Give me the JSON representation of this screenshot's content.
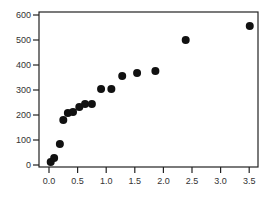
{
  "chart_data": {
    "type": "scatter",
    "title": "",
    "xlabel": "",
    "ylabel": "",
    "xlim": [
      -0.05,
      3.6
    ],
    "ylim": [
      -10,
      610
    ],
    "x_ticks": [
      0.0,
      0.5,
      1.0,
      1.5,
      2.0,
      2.5,
      3.0,
      3.5
    ],
    "x_tick_labels": [
      "0.0",
      "0.5",
      "1.0",
      "1.5",
      "2.0",
      "2.5",
      "3.0",
      "3.5"
    ],
    "y_ticks": [
      0,
      100,
      200,
      300,
      400,
      500,
      600
    ],
    "y_tick_labels": [
      "0",
      "100",
      "200",
      "300",
      "400",
      "500",
      "600"
    ],
    "grid": false,
    "legend": null,
    "marker_color": "#111111",
    "series": [
      {
        "name": "data",
        "points": [
          {
            "x": 0.03,
            "y": 12
          },
          {
            "x": 0.09,
            "y": 28
          },
          {
            "x": 0.19,
            "y": 84
          },
          {
            "x": 0.25,
            "y": 180
          },
          {
            "x": 0.33,
            "y": 208
          },
          {
            "x": 0.42,
            "y": 212
          },
          {
            "x": 0.53,
            "y": 232
          },
          {
            "x": 0.63,
            "y": 244
          },
          {
            "x": 0.75,
            "y": 244
          },
          {
            "x": 0.91,
            "y": 304
          },
          {
            "x": 1.09,
            "y": 304
          },
          {
            "x": 1.28,
            "y": 356
          },
          {
            "x": 1.54,
            "y": 368
          },
          {
            "x": 1.86,
            "y": 376
          },
          {
            "x": 2.39,
            "y": 500
          },
          {
            "x": 3.51,
            "y": 556
          }
        ]
      }
    ]
  }
}
